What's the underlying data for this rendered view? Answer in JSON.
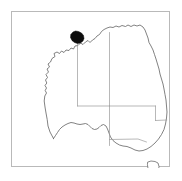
{
  "figure": {
    "type": "distribution-map",
    "region": "Australia",
    "frame": {
      "x": 11,
      "y": 11,
      "width": 159,
      "height": 156,
      "border_color": "#b9b9b9"
    },
    "background_color": "#ffffff",
    "coastline_color": "#585858",
    "state_border_color": "#9a9a9a",
    "patch_color": "#0d0d0d"
  },
  "chart_data": {
    "type": "map",
    "title": "",
    "subtitle": "",
    "xlabel": "",
    "ylabel": "",
    "legend": [],
    "annotations": [],
    "shapes": {
      "mainland_outline": "M 41.5 126.5 L 38.0 120.0 L 36.0 114.0 L 35.2 107.5 L 34.0 101.0 L 33.0 95.0 L 32.2 89.0 L 32.8 84.0 L 34.5 81.0 L 33.2 78.5 L 34.5 76.0 L 33.0 73.5 L 34.8 71.0 L 33.5 68.0 L 35.5 65.5 L 34.0 62.5 L 36.5 60.0 L 35.0 57.0 L 37.5 55.0 L 36.0 52.0 L 38.5 50.0 L 40.0 46.5 L 43.0 44.5 L 42.0 41.5 L 45.0 40.0 L 47.5 41.5 L 49.5 39.0 L 52.0 40.5 L 54.0 38.0 L 57.0 38.5 L 59.0 36.0 L 61.5 37.0 L 63.0 34.0 L 66.0 33.5 L 68.5 31.0 L 71.0 32.5 L 73.5 30.0 L 76.0 28.5 L 78.0 30.5 L 80.5 28.0 L 83.0 26.5 L 85.0 24.0 L 87.5 22.5 L 89.5 19.5 L 92.0 17.5 L 95.0 16.0 L 98.0 15.0 L 101.0 15.5 L 104.0 14.0 L 107.0 15.0 L 110.0 13.5 L 113.5 14.5 L 116.0 13.0 L 119.0 14.5 L 122.0 13.0 L 125.0 14.0 L 128.0 13.0 L 131.0 15.0 L 133.0 18.0 L 134.5 22.0 L 136.0 26.0 L 137.0 30.5 L 139.0 34.0 L 141.0 38.0 L 142.5 42.5 L 144.0 47.0 L 145.5 52.0 L 147.0 57.0 L 148.0 62.0 L 149.5 67.0 L 151.0 72.0 L 152.0 77.0 L 153.0 82.5 L 154.0 88.0 L 154.5 94.0 L 155.0 100.0 L 154.5 106.0 L 153.5 112.0 L 152.0 117.5 L 149.5 122.5 L 146.5 127.0 L 143.0 131.0 L 139.0 134.5 L 135.0 137.0 L 131.0 138.5 L 127.0 139.0 L 123.0 138.0 L 119.0 136.0 L 115.0 134.5 L 111.0 134.0 L 107.5 133.0 L 104.0 131.0 L 101.0 128.5 L 98.5 125.0 L 97.0 121.0 L 95.5 117.0 L 94.0 114.0 L 91.5 112.5 L 89.0 113.5 L 87.0 115.5 L 85.0 117.0 L 82.5 117.5 L 80.0 116.5 L 78.0 114.5 L 76.0 112.5 L 73.5 111.5 L 71.0 112.0 L 68.0 112.5 L 65.0 112.0 L 62.0 111.0 L 59.0 110.5 L 56.0 111.5 L 53.0 113.0 L 50.0 115.0 L 47.5 117.5 L 45.5 120.5 L 43.5 123.5 L 41.5 126.5 Z",
      "tasmania_outline": "M 136.0 150.0 L 139.0 149.0 L 143.0 149.5 L 146.0 151.0 L 147.0 154.5 L 146.5 158.0 L 145.0 161.0 L 143.0 163.5 L 140.5 164.5 L 138.0 163.0 L 136.5 160.0 L 136.0 156.5 L 135.5 153.0 Z",
      "distribution_patch": "M 61.0 20.0 L 63.5 19.0 L 66.5 19.5 L 69.5 21.0 L 71.5 23.5 L 72.0 26.5 L 71.0 29.0 L 68.5 31.0 L 65.5 31.5 L 62.5 30.5 L 60.0 28.5 L 58.5 25.5 L 58.8 22.5 Z",
      "state_borders": [
        "M 65.5 31.5 L 65.5 94.0",
        "M 97.5 20.5 L 97.5 94.0",
        "M 65.5 94.0 L 143.5 94.0",
        "M 143.5 94.0 L 143.5 108.5",
        "M 97.5 94.0 L 97.5 133.5",
        "M 143.5 108.5 L 154.8 108.0",
        "M 97.5 127.5 L 126.0 127.0 L 134.5 130.0"
      ]
    },
    "axis": {
      "grid": false,
      "visible_frame": true
    }
  }
}
